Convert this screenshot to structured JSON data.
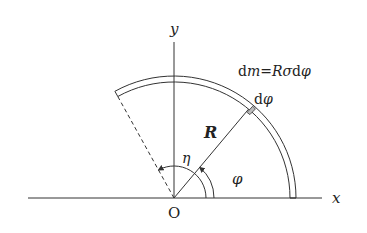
{
  "diagram": {
    "type": "physics-geometry",
    "labels": {
      "y_axis": "y",
      "x_axis": "x",
      "origin": "O",
      "radius": "R",
      "eta": "η",
      "phi": "φ",
      "element": "dφ",
      "mass_element": "dm=Rσdφ"
    },
    "mass_formula": {
      "lhs_d": "d",
      "lhs_m": "m",
      "eq": "=",
      "r": "R",
      "sigma": "σ",
      "d": "d",
      "phi": "φ"
    },
    "element_label": {
      "d": "d",
      "phi": "φ"
    },
    "geometry": {
      "origin": [
        174,
        198
      ],
      "radius_outer": 122,
      "radius_inner": 116,
      "arc_start_deg": 0,
      "arc_end_deg": 119,
      "element_angle_deg": 50
    },
    "colors": {
      "stroke": "#333333",
      "background": "#ffffff"
    }
  }
}
